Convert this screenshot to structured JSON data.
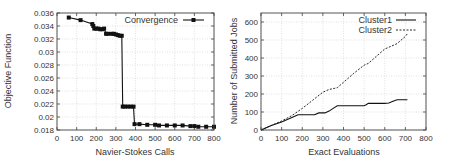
{
  "chart_data": [
    {
      "type": "line",
      "title": "",
      "xlabel": "Navier-Stokes Calls",
      "ylabel": "Objective Function",
      "xlim": [
        0,
        800
      ],
      "ylim": [
        0.018,
        0.036
      ],
      "xticks": [
        "0",
        "100",
        "200",
        "300",
        "400",
        "500",
        "600",
        "700",
        "800"
      ],
      "yticks": [
        "0.018",
        "0.02",
        "0.022",
        "0.024",
        "0.026",
        "0.028",
        "0.03",
        "0.032",
        "0.034",
        "0.036"
      ],
      "grid": true,
      "legend_position": "top-right",
      "series": [
        {
          "name": "Convergence",
          "style": "line-with-square-markers",
          "x": [
            60,
            120,
            180,
            185,
            190,
            200,
            210,
            220,
            230,
            240,
            250,
            260,
            280,
            290,
            300,
            310,
            320,
            330,
            335,
            345,
            360,
            375,
            390,
            395,
            420,
            460,
            500,
            520,
            560,
            600,
            640,
            680,
            700,
            720,
            760,
            800
          ],
          "y": [
            0.0353,
            0.0349,
            0.0343,
            0.034,
            0.0336,
            0.0336,
            0.0336,
            0.0335,
            0.0335,
            0.0336,
            0.0328,
            0.0328,
            0.0328,
            0.0328,
            0.0327,
            0.0326,
            0.0325,
            0.0325,
            0.0216,
            0.0216,
            0.0216,
            0.0216,
            0.0216,
            0.0189,
            0.0189,
            0.0188,
            0.0188,
            0.0187,
            0.0187,
            0.0187,
            0.0187,
            0.0186,
            0.0186,
            0.0185,
            0.0185,
            0.0185
          ]
        }
      ]
    },
    {
      "type": "line",
      "title": "",
      "xlabel": "Exact Evaluations",
      "ylabel": "Number of Submitted Jobs",
      "xlim": [
        0,
        800
      ],
      "ylim": [
        0,
        650
      ],
      "xticks": [
        "0",
        "100",
        "200",
        "300",
        "400",
        "500",
        "600",
        "700",
        "800"
      ],
      "yticks": [
        "0",
        "100",
        "200",
        "300",
        "400",
        "500",
        "600"
      ],
      "grid": true,
      "legend_position": "top-right",
      "series": [
        {
          "name": "Cluster1",
          "style": "solid",
          "x": [
            0,
            50,
            100,
            150,
            180,
            200,
            260,
            280,
            310,
            330,
            350,
            370,
            420,
            500,
            510,
            520,
            600,
            620,
            640,
            660,
            700,
            710
          ],
          "y": [
            0,
            25,
            45,
            70,
            85,
            85,
            85,
            95,
            95,
            105,
            120,
            135,
            135,
            135,
            140,
            148,
            148,
            150,
            160,
            168,
            168,
            168
          ]
        },
        {
          "name": "Cluster2",
          "style": "dashed",
          "x": [
            0,
            50,
            100,
            150,
            200,
            250,
            300,
            330,
            370,
            400,
            450,
            500,
            520,
            560,
            600,
            620,
            660,
            700,
            710
          ],
          "y": [
            0,
            25,
            50,
            80,
            120,
            165,
            210,
            225,
            235,
            265,
            315,
            360,
            370,
            410,
            450,
            460,
            480,
            520,
            535
          ]
        }
      ]
    }
  ]
}
